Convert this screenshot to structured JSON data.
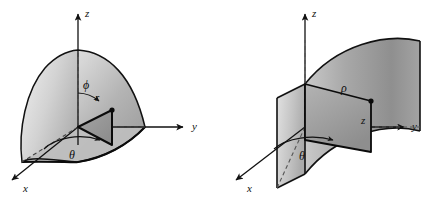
{
  "figure": {
    "background_color": "#ffffff",
    "line_color": "#111111",
    "surface_light": "#e6e6e6",
    "surface_mid": "#b8b8b8",
    "surface_dark": "#8f8f8f",
    "width": 422,
    "height": 197
  },
  "diagrams": [
    {
      "id": "spherical",
      "name": "spherical-coordinates-diagram",
      "shape": "sphere-octant",
      "axes": [
        {
          "id": "z",
          "label": "z",
          "direction": "up"
        },
        {
          "id": "y",
          "label": "y",
          "direction": "right"
        },
        {
          "id": "x",
          "label": "x",
          "direction": "lower-left"
        }
      ],
      "labels": [
        {
          "id": "phi",
          "text": "ϕ",
          "meaning": "polar-angle-from-z-axis"
        },
        {
          "id": "r",
          "text": "r",
          "meaning": "radial-distance"
        },
        {
          "id": "theta",
          "text": "θ",
          "meaning": "azimuthal-angle-in-xy-plane"
        }
      ]
    },
    {
      "id": "cylindrical",
      "name": "cylindrical-coordinates-diagram",
      "shape": "cylinder-quarter-wedge",
      "axes": [
        {
          "id": "z",
          "label": "z",
          "direction": "up"
        },
        {
          "id": "y",
          "label": "y",
          "direction": "right"
        },
        {
          "id": "x",
          "label": "x",
          "direction": "lower-left"
        }
      ],
      "labels": [
        {
          "id": "rho",
          "text": "ρ",
          "meaning": "radial-distance-in-xy-plane"
        },
        {
          "id": "z",
          "text": "z",
          "meaning": "height-along-z-axis"
        },
        {
          "id": "theta",
          "text": "θ",
          "meaning": "azimuthal-angle-in-xy-plane"
        }
      ]
    }
  ]
}
